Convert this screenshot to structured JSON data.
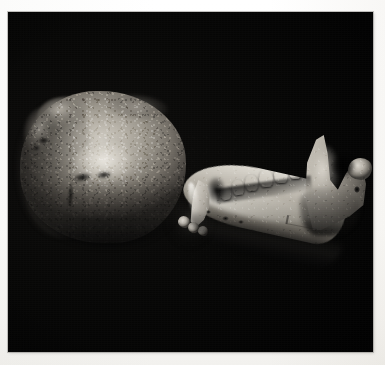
{
  "page": {
    "background_color": "#fdfdfd",
    "width": 385,
    "height": 365
  },
  "photograph": {
    "alt_text": "Black-and-white photograph of a weathered cranium and a mandible on a black background",
    "background_color": "#010101",
    "border_color": "#969490",
    "frame": {
      "left": 8,
      "top": 12,
      "width": 365,
      "height": 340
    },
    "lighting": "directional light from upper left",
    "subjects": [
      {
        "name": "cranium",
        "label": "Cranium",
        "description": "Rounded braincase seen from above and behind, heavily weathered with adhering sediment crust and flaked surface",
        "highlight_color": "#d2cec5",
        "midtone_color": "#9a958b",
        "shadow_color": "#2b2926",
        "features": [
          {
            "name": "vault-highlight",
            "label": "Specular highlight on vault"
          },
          {
            "name": "sediment-crust",
            "label": "Adhering sediment crust"
          },
          {
            "name": "cranial-fissures",
            "label": "Dark fissures and damage"
          },
          {
            "name": "shadowed-hemisphere",
            "label": "Shadowed left hemisphere"
          }
        ]
      },
      {
        "name": "mandible",
        "label": "Mandible",
        "description": "Lower jaw in left lateral view showing corpus, tooth row, ascending ramus, mandibular notch and condyle",
        "highlight_color": "#efece5",
        "midtone_color": "#b3aea4",
        "shadow_color": "#312f2c",
        "features": [
          {
            "name": "corpus",
            "label": "Mandibular corpus"
          },
          {
            "name": "ramus",
            "label": "Ascending ramus"
          },
          {
            "name": "coronoid-process",
            "label": "Coronoid process"
          },
          {
            "name": "mandibular-notch",
            "label": "Mandibular notch"
          },
          {
            "name": "condyle",
            "label": "Mandibular condyle"
          },
          {
            "name": "mandibular-foramen",
            "label": "Mandibular foramen"
          },
          {
            "name": "canine",
            "label": "Canine tooth"
          },
          {
            "name": "incisors",
            "label": "Incisor stubs"
          },
          {
            "name": "diastema",
            "label": "Diastema"
          },
          {
            "name": "mental-foramina",
            "label": "Mental foramina"
          },
          {
            "name": "catalogue-inscription",
            "label": "Faint inked catalogue inscription (illegible)"
          }
        ],
        "tooth_row": {
          "label": "Cheek tooth row",
          "count": 6,
          "teeth": [
            {
              "position": 1,
              "label": "P3"
            },
            {
              "position": 2,
              "label": "P4"
            },
            {
              "position": 3,
              "label": "M1"
            },
            {
              "position": 4,
              "label": "M2"
            },
            {
              "position": 5,
              "label": "M3"
            },
            {
              "position": 6,
              "label": "M3 distal"
            }
          ]
        }
      }
    ]
  }
}
